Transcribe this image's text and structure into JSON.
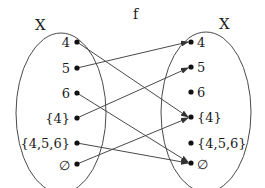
{
  "function_label": "f",
  "domain_set": {
    "label": "X",
    "elements": [
      "4",
      "5",
      "6",
      "{4}",
      "{4,5,6}",
      "∅"
    ]
  },
  "codomain_set": {
    "label": "X",
    "elements": [
      "4",
      "5",
      "6",
      "{4}",
      "{4,5,6}",
      "∅"
    ]
  },
  "mapping": [
    {
      "from": "4",
      "to": "{4}"
    },
    {
      "from": "5",
      "to": "4"
    },
    {
      "from": "6",
      "to": "∅"
    },
    {
      "from": "{4}",
      "to": "5"
    },
    {
      "from": "{4,5,6}",
      "to": "∅"
    },
    {
      "from": "∅",
      "to": "{4}"
    }
  ],
  "colors": {
    "line": "#4a4a4a",
    "dot": "#111111",
    "text": "#1a1a1a"
  }
}
